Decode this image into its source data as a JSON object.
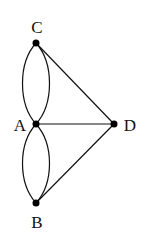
{
  "diagram": {
    "type": "multigraph",
    "nodes": [
      {
        "id": "C",
        "label": "C",
        "x": 36,
        "y": 43,
        "label_x": 37,
        "label_y": 33
      },
      {
        "id": "A",
        "label": "A",
        "x": 36,
        "y": 124,
        "label_x": 20,
        "label_y": 131
      },
      {
        "id": "D",
        "label": "D",
        "x": 114,
        "y": 124,
        "label_x": 130,
        "label_y": 131
      },
      {
        "id": "B",
        "label": "B",
        "x": 36,
        "y": 203,
        "label_x": 37,
        "label_y": 228
      }
    ],
    "edges": [
      {
        "from": "A",
        "to": "C",
        "curve": "left"
      },
      {
        "from": "A",
        "to": "C",
        "curve": "right"
      },
      {
        "from": "A",
        "to": "B",
        "curve": "left"
      },
      {
        "from": "A",
        "to": "B",
        "curve": "right"
      },
      {
        "from": "A",
        "to": "D",
        "curve": "straight"
      },
      {
        "from": "C",
        "to": "D",
        "curve": "straight"
      },
      {
        "from": "B",
        "to": "D",
        "curve": "straight"
      }
    ],
    "colors": {
      "stroke": "#111111",
      "node": "#000000",
      "background": "#ffffff"
    }
  }
}
